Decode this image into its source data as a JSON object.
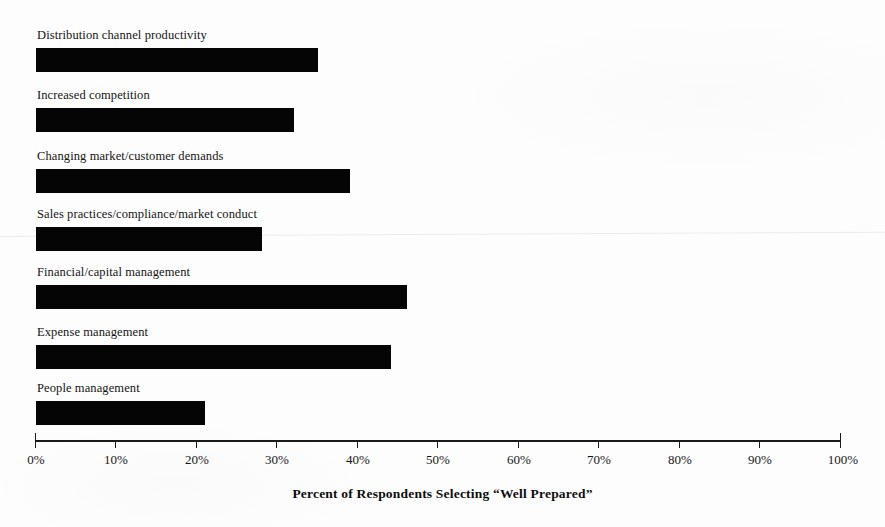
{
  "chart_data": {
    "type": "bar",
    "orientation": "horizontal",
    "title": "",
    "subtitle": "",
    "xlabel": "Percent of Respondents Selecting “Well Prepared”",
    "ylabel": "",
    "categories": [
      "Distribution channel productivity",
      "Increased competition",
      "Changing market/customer demands",
      "Sales practices/compliance/market conduct",
      "Financial/capital management",
      "Expense management",
      "People management"
    ],
    "values": [
      35,
      32,
      39,
      28,
      46,
      44,
      21
    ],
    "value_suffix": "%",
    "xlim": [
      0,
      100
    ],
    "ylim": null,
    "grid": false,
    "legend": null,
    "legend_position": "none",
    "bar_color": "#050505",
    "background_color": "#fdfdfd",
    "axis_color": "#1a1a1a",
    "tick_labels": [
      "0%",
      "10%",
      "20%",
      "30%",
      "40%",
      "50%",
      "60%",
      "70%",
      "80%",
      "90%",
      "100%"
    ],
    "tick_values": [
      0,
      10,
      20,
      30,
      40,
      50,
      60,
      70,
      80,
      90,
      100
    ],
    "annotations": []
  }
}
